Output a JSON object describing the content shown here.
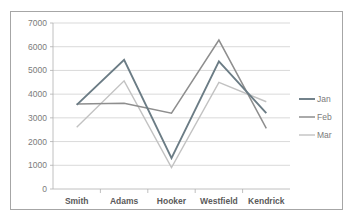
{
  "chart_data": {
    "type": "line",
    "title": "",
    "subtitle": "",
    "xlabel": "",
    "ylabel": "",
    "categories": [
      "Smith",
      "Adams",
      "Hooker",
      "Westfield",
      "Kendrick"
    ],
    "series": [
      {
        "name": "Jan",
        "values": [
          3550,
          5450,
          1300,
          5380,
          3200
        ],
        "color": "#6b7c85"
      },
      {
        "name": "Feb",
        "values": [
          3580,
          3620,
          3200,
          6280,
          2560
        ],
        "color": "#8e8e8e"
      },
      {
        "name": "Mar",
        "values": [
          2600,
          4560,
          900,
          4500,
          3680
        ],
        "color": "#c2c2c2"
      }
    ],
    "ylim": [
      0,
      7000
    ],
    "ytick_values": [
      0,
      1000,
      2000,
      3000,
      4000,
      5000,
      6000,
      7000
    ],
    "ytick_labels": [
      "0",
      "1000",
      "2000",
      "3000",
      "4000",
      "5000",
      "6000",
      "7000"
    ],
    "grid": "horizontal",
    "legend_position": "right",
    "legend_entries": [
      "Jan",
      "Feb",
      "Mar"
    ],
    "plot_background": "#ffffff",
    "grid_color": "#c9c9c9",
    "axis_color": "#b0b0b0",
    "border_color": "#a6a6a6",
    "tick_label_color": "#7b7b7b",
    "category_label_color": "#5a5a5a"
  }
}
